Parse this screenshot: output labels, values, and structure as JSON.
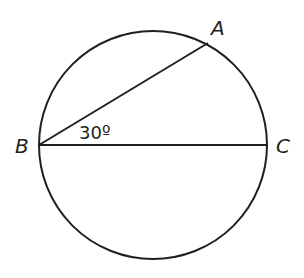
{
  "diagram": {
    "type": "circle-geometry",
    "circle": {
      "cx": 153,
      "cy": 145,
      "r": 114
    },
    "points": [
      {
        "name": "A",
        "x": 208,
        "y": 43,
        "label_x": 211,
        "label_y": 35
      },
      {
        "name": "B",
        "x": 39,
        "y": 145,
        "label_x": 15,
        "label_y": 153
      },
      {
        "name": "C",
        "x": 267,
        "y": 145,
        "label_x": 276,
        "label_y": 153
      }
    ],
    "segments": [
      {
        "from": "B",
        "to": "A"
      },
      {
        "from": "B",
        "to": "C",
        "note": "diameter"
      }
    ],
    "angle_label": {
      "text": "30º",
      "vertex": "B",
      "x": 79,
      "y": 139
    },
    "stroke_color": "#231f20"
  }
}
